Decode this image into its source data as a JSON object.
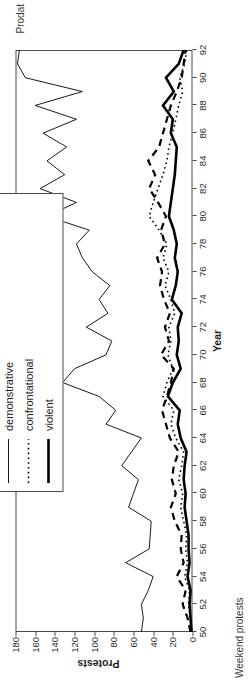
{
  "figure": {
    "caption_left": "Weekend protests",
    "caption_right": "Prodat"
  },
  "legend": {
    "position": "top-right-outside",
    "items": [
      {
        "label": "conventional",
        "style": "dashed",
        "color": "#000000"
      },
      {
        "label": "demonstrative",
        "style": "thin-solid",
        "color": "#000000"
      },
      {
        "label": "confrontational",
        "style": "dotted",
        "color": "#000000"
      },
      {
        "label": "violent",
        "style": "thick-solid",
        "color": "#000000"
      }
    ]
  },
  "chart_data": {
    "type": "line",
    "title": "",
    "subtitle": "",
    "xlabel": "Year",
    "ylabel": "Protests",
    "xlim": [
      50,
      92
    ],
    "ylim": [
      0,
      180
    ],
    "ytick_step": 20,
    "xtick_step": 2,
    "grid": false,
    "x": [
      50,
      51,
      52,
      53,
      54,
      55,
      56,
      57,
      58,
      59,
      60,
      61,
      62,
      63,
      64,
      65,
      66,
      67,
      68,
      69,
      70,
      71,
      72,
      73,
      74,
      75,
      76,
      77,
      78,
      79,
      80,
      81,
      82,
      83,
      84,
      85,
      86,
      87,
      88,
      89,
      90,
      91,
      92
    ],
    "xtick_labels": [
      "50",
      "52",
      "54",
      "56",
      "58",
      "60",
      "62",
      "64",
      "66",
      "68",
      "70",
      "72",
      "74",
      "76",
      "78",
      "80",
      "82",
      "84",
      "86",
      "88",
      "90",
      "92"
    ],
    "ytick_labels": [
      "0",
      "20",
      "40",
      "60",
      "80",
      "100",
      "120",
      "140",
      "160",
      "180"
    ],
    "series": [
      {
        "name": "conventional",
        "style": "dashed",
        "values": [
          2,
          5,
          10,
          7,
          16,
          9,
          12,
          11,
          18,
          22,
          17,
          21,
          19,
          14,
          23,
          27,
          31,
          26,
          22,
          19,
          32,
          24,
          28,
          23,
          29,
          33,
          31,
          36,
          28,
          32,
          27,
          35,
          44,
          38,
          45,
          34,
          30,
          26,
          22,
          16,
          11,
          9,
          7
        ]
      },
      {
        "name": "demonstrative",
        "style": "thin-solid",
        "values": [
          52,
          50,
          52,
          45,
          40,
          68,
          44,
          43,
          42,
          65,
          60,
          55,
          72,
          62,
          52,
          88,
          78,
          95,
          132,
          120,
          88,
          82,
          108,
          86,
          95,
          84,
          102,
          112,
          118,
          105,
          148,
          118,
          155,
          130,
          148,
          128,
          152,
          118,
          160,
          112,
          170,
          178,
          176
        ]
      },
      {
        "name": "confrontational",
        "style": "dotted",
        "values": [
          1,
          2,
          4,
          3,
          8,
          5,
          7,
          6,
          9,
          12,
          10,
          14,
          11,
          9,
          17,
          22,
          19,
          30,
          26,
          20,
          25,
          22,
          24,
          18,
          22,
          28,
          24,
          30,
          26,
          34,
          44,
          40,
          35,
          30,
          26,
          24,
          20,
          17,
          14,
          10,
          13,
          8,
          6
        ]
      },
      {
        "name": "violent",
        "style": "thick-solid",
        "values": [
          1,
          2,
          3,
          2,
          5,
          3,
          4,
          4,
          6,
          8,
          7,
          9,
          8,
          6,
          12,
          15,
          13,
          25,
          20,
          12,
          16,
          14,
          15,
          11,
          21,
          17,
          15,
          18,
          16,
          19,
          24,
          22,
          20,
          18,
          17,
          16,
          22,
          20,
          30,
          19,
          27,
          14,
          9
        ]
      }
    ]
  }
}
